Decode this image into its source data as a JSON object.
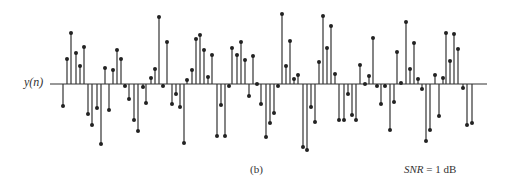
{
  "figure": {
    "ylabel": "y(n)",
    "caption": "(b)",
    "snr_label_var": "SNR",
    "snr_label_rest": " = 1 dB"
  },
  "chart_data": {
    "type": "stem",
    "title": "",
    "xlabel": "",
    "ylabel": "y(n)",
    "annotations": [
      "(b)",
      "SNR = 1 dB"
    ],
    "grid": false,
    "legend": null,
    "axis": {
      "baseline_y_px": 84,
      "x_start_px": 50,
      "x_end_px": 487
    },
    "note": "Sampled noisy sequence; values are relative amplitudes (pixels above baseline, positive up).",
    "x": [
      63,
      67,
      71,
      76,
      80,
      84,
      88,
      92,
      97,
      101,
      105,
      109,
      113,
      117,
      121,
      125,
      129,
      134,
      138,
      143,
      146,
      151,
      155,
      159,
      163,
      167,
      172,
      176,
      180,
      184,
      187,
      192,
      196,
      200,
      204,
      208,
      212,
      217,
      221,
      225,
      229,
      232,
      237,
      241,
      245,
      249,
      253,
      257,
      261,
      266,
      270,
      274,
      278,
      282,
      286,
      290,
      294,
      298,
      303,
      307,
      311,
      315,
      319,
      323,
      327,
      331,
      335,
      339,
      344,
      348,
      352,
      356,
      360,
      365,
      369,
      373,
      377,
      381,
      385,
      390,
      394,
      397,
      401,
      406,
      410,
      414,
      418,
      422,
      426,
      430,
      435,
      439,
      443,
      446,
      450,
      454,
      458,
      463,
      467,
      472
    ],
    "values": [
      -22,
      25,
      51,
      31,
      18,
      37,
      -30,
      -41,
      -24,
      -60,
      16,
      -26,
      14,
      34,
      25,
      -2,
      -15,
      -36,
      -47,
      -3,
      -19,
      6,
      15,
      67,
      -2,
      42,
      -20,
      -10,
      -23,
      -59,
      4,
      14,
      45,
      49,
      34,
      7,
      29,
      -52,
      -21,
      -52,
      -2,
      36,
      29,
      42,
      24,
      -12,
      28,
      0,
      -20,
      -53,
      -39,
      -29,
      -2,
      70,
      18,
      43,
      5,
      9,
      -63,
      -66,
      -23,
      -38,
      22,
      68,
      36,
      58,
      10,
      -36,
      -36,
      -10,
      -31,
      -36,
      19,
      0,
      8,
      46,
      -2,
      -20,
      -2,
      -46,
      -18,
      32,
      1,
      62,
      15,
      41,
      5,
      -5,
      -57,
      -46,
      9,
      -32,
      6,
      51,
      23,
      50,
      35,
      -4,
      -41,
      -39
    ]
  }
}
